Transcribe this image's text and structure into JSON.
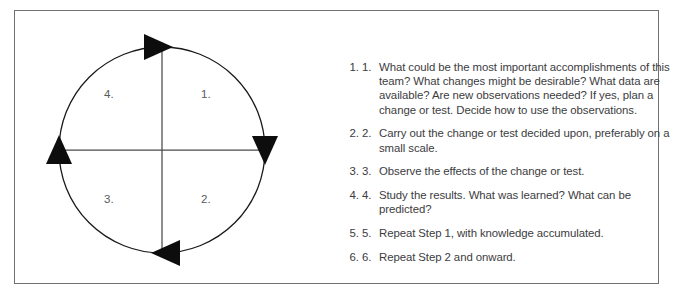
{
  "diagram": {
    "title_alt": "Shewhart PDSA cycle",
    "circle": {
      "center_x": 122,
      "center_y": 122,
      "radius": 103,
      "stroke_color": "#1a1a1a"
    },
    "arrow_color": "#0d0d0d",
    "arrows": [
      {
        "name": "top-arrow",
        "position": "top",
        "direction": "right"
      },
      {
        "name": "right-arrow",
        "position": "right",
        "direction": "down"
      },
      {
        "name": "bottom-arrow",
        "position": "bottom",
        "direction": "left"
      },
      {
        "name": "left-arrow",
        "position": "left",
        "direction": "up"
      }
    ],
    "quadrant_labels": {
      "top_right": "1.",
      "bottom_right": "2.",
      "bottom_left": "3.",
      "top_left": "4."
    },
    "label_color": "#59595b"
  },
  "steps": [
    {
      "number": "1.",
      "text": "What could be the most important accomplishments of this team? What changes might be desirable? What data are available? Are new observations needed? If yes, plan a change or test. Decide how to use the observations."
    },
    {
      "number": "2.",
      "text": "Carry out the change or test decided upon, preferably on a small scale."
    },
    {
      "number": "3.",
      "text": "Observe the effects of the change or test."
    },
    {
      "number": "4.",
      "text": "Study the results. What was learned? What can be predicted?"
    },
    {
      "number": "5.",
      "text": "Repeat Step 1, with knowledge accumulated."
    },
    {
      "number": "6.",
      "text": "Repeat Step 2 and onward."
    }
  ],
  "frame": {
    "border_color": "#6f7174"
  },
  "page": {
    "background": "#ffffff",
    "text_color": "#3c3c3e"
  }
}
